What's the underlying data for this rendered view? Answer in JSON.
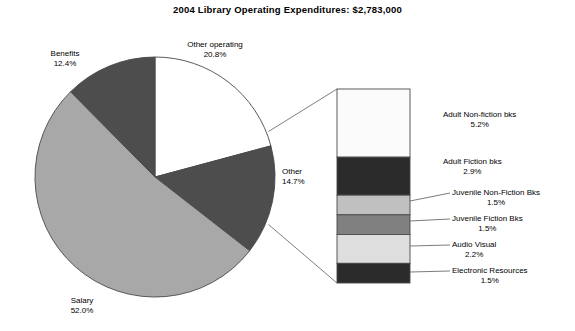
{
  "chart_data": {
    "type": "pie",
    "title": "2004 Library Operating Expenditures: $2,783,000",
    "total_label": "$2,783,000",
    "year": "2004",
    "xlabel": "",
    "ylabel": "",
    "legend": "none",
    "grid": false,
    "categories": [
      "Other operating",
      "Other",
      "Salary",
      "Benefits"
    ],
    "values": [
      20.8,
      14.7,
      52.0,
      12.4
    ],
    "units": "percent",
    "slices": [
      {
        "label": "Other operating",
        "percent": "20.8%",
        "value": 20.8,
        "color": "#ffffff"
      },
      {
        "label": "Other",
        "percent": "14.7%",
        "value": 14.7,
        "color": "#4d4d4d"
      },
      {
        "label": "Salary",
        "percent": "52.0%",
        "value": 52.0,
        "color": "#a8a8a8"
      },
      {
        "label": "Benefits",
        "percent": "12.4%",
        "value": 12.4,
        "color": "#4d4d4d"
      }
    ],
    "breakout": {
      "type": "bar",
      "of_slice": "Other",
      "orientation": "vertical-stacked",
      "categories": [
        "Adult Non-fiction bks",
        "Adult Fiction bks",
        "Juvenile Non-Fiction Bks",
        "Juvenile Fiction Bks",
        "Audio Visual",
        "Electronic Resources"
      ],
      "values": [
        5.2,
        2.9,
        1.5,
        1.5,
        2.2,
        1.5
      ],
      "segments": [
        {
          "label": "Adult Non-fiction bks",
          "percent": "5.2%",
          "value": 5.2,
          "color": "#fbfbfb"
        },
        {
          "label": "Adult Fiction bks",
          "percent": "2.9%",
          "value": 2.9,
          "color": "#2b2b2b"
        },
        {
          "label": "Juvenile Non-Fiction Bks",
          "percent": "1.5%",
          "value": 1.5,
          "color": "#c0c0c0"
        },
        {
          "label": "Juvenile Fiction Bks",
          "percent": "1.5%",
          "value": 1.5,
          "color": "#808080"
        },
        {
          "label": "Audio Visual",
          "percent": "2.2%",
          "value": 2.2,
          "color": "#dedede"
        },
        {
          "label": "Electronic Resources",
          "percent": "1.5%",
          "value": 1.5,
          "color": "#2b2b2b"
        }
      ]
    }
  },
  "title": "2004 Library Operating Expenditures: $2,783,000",
  "pie": {
    "benefits": {
      "label": "Benefits",
      "percent": "12.4%"
    },
    "otherop": {
      "label": "Other operating",
      "percent": "20.8%"
    },
    "other": {
      "label": "Other",
      "percent": "14.7%"
    },
    "salary": {
      "label": "Salary",
      "percent": "52.0%"
    }
  },
  "bar": {
    "adult_nonfiction": {
      "label": "Adult Non-fiction bks",
      "percent": "5.2%"
    },
    "adult_fiction": {
      "label": "Adult Fiction bks",
      "percent": "2.9%"
    },
    "juv_nonfiction": {
      "label": "Juvenile Non-Fiction Bks",
      "percent": "1.5%"
    },
    "juv_fiction": {
      "label": "Juvenile Fiction Bks",
      "percent": "1.5%"
    },
    "audio_visual": {
      "label": "Audio Visual",
      "percent": "2.2%"
    },
    "electronic": {
      "label": "Electronic Resources",
      "percent": "1.5%"
    }
  }
}
